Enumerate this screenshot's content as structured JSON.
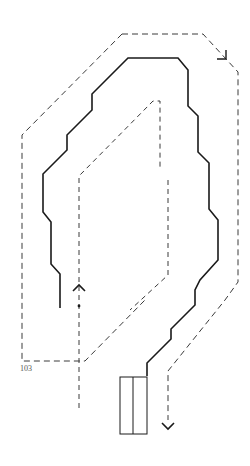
{
  "figure": {
    "background": "#ffffff",
    "stroke_color": "#1a1a1a",
    "dashed_color": "#333333",
    "reference_numeral": "103",
    "paths": {
      "outer_dashed_loop": {
        "style": "dashed",
        "points": [
          [
            122,
            34
          ],
          [
            203,
            34
          ],
          [
            238,
            72
          ],
          [
            238,
            282
          ],
          [
            225,
            300
          ],
          [
            168,
            371
          ],
          [
            168,
            420
          ]
        ],
        "end_marker": "arrow-down"
      },
      "outer_dashed_arrow_top": {
        "style": "solid",
        "description": "arrowhead on outer loop near top-right",
        "points": [
          [
            217,
            59
          ],
          [
            226,
            59
          ],
          [
            226,
            50
          ]
        ]
      },
      "left_outer_dashed": {
        "style": "dashed",
        "points": [
          [
            122,
            34
          ],
          [
            22,
            135
          ],
          [
            22,
            361
          ],
          [
            85,
            361
          ],
          [
            145,
            300
          ]
        ]
      },
      "inner_dashed_path": {
        "style": "dashed",
        "points": [
          [
            79,
            408
          ],
          [
            79,
            176
          ],
          [
            153,
            101
          ],
          [
            160,
            101
          ],
          [
            160,
            170
          ]
        ],
        "start_marker": "dot",
        "arrow": "arrow-up"
      },
      "inner_dashed_right": {
        "style": "dashed",
        "points": [
          [
            168,
            180
          ],
          [
            168,
            275
          ],
          [
            130,
            310
          ]
        ]
      },
      "solid_wall_trace": {
        "style": "solid",
        "points": [
          [
            60,
            308
          ],
          [
            60,
            274
          ],
          [
            51,
            264
          ],
          [
            51,
            222
          ],
          [
            43,
            212
          ],
          [
            43,
            174
          ],
          [
            67,
            150
          ],
          [
            67,
            135
          ],
          [
            92,
            110
          ],
          [
            92,
            94
          ],
          [
            128,
            58
          ],
          [
            163,
            58
          ],
          [
            178,
            58
          ],
          [
            188,
            70
          ],
          [
            188,
            106
          ],
          [
            198,
            116
          ],
          [
            198,
            152
          ],
          [
            209,
            163
          ],
          [
            209,
            209
          ],
          [
            218,
            220
          ],
          [
            218,
            260
          ],
          [
            200,
            280
          ],
          [
            195,
            290
          ],
          [
            195,
            305
          ],
          [
            171,
            329
          ],
          [
            171,
            339
          ],
          [
            147,
            363
          ],
          [
            147,
            376
          ]
        ]
      }
    },
    "rectangle": {
      "x": 120,
      "y": 377,
      "width": 27,
      "height": 57,
      "divider_x": 133
    }
  }
}
